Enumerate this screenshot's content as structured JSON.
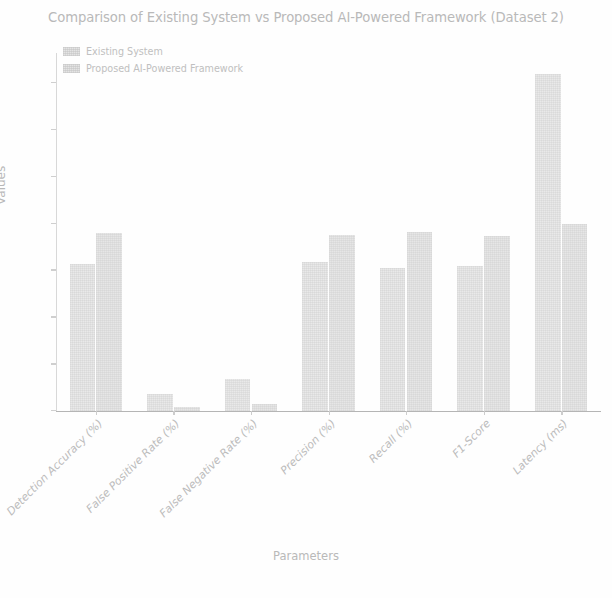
{
  "chart_data": {
    "type": "bar",
    "title": "Comparison of Existing System vs Proposed AI-Powered Framework (Dataset 2)",
    "xlabel": "Parameters",
    "ylabel": "Values",
    "categories": [
      "Detection Accuracy (%)",
      "False Positive Rate (%)",
      "False Negative Rate (%)",
      "Precision (%)",
      "Recall (%)",
      "F1-Score",
      "Latency (ms)"
    ],
    "series": [
      {
        "name": "Existing System",
        "color": "#e9e9e9",
        "values": [
          78.5,
          9.2,
          17.0,
          79.5,
          76.5,
          77.5,
          180.0
        ]
      },
      {
        "name": "Proposed AI-Powered Framework",
        "color": "#e6e6e6",
        "values": [
          95.0,
          2.0,
          4.0,
          94.0,
          95.5,
          93.5,
          100.0
        ]
      }
    ],
    "yticks": [
      0,
      25,
      50,
      75,
      100,
      125,
      150,
      175
    ],
    "ylim": [
      0,
      190
    ],
    "grid": false,
    "legend_position": "upper left",
    "xtick_rotation": -45
  },
  "legend": {
    "items": [
      {
        "label": "Existing System"
      },
      {
        "label": "Proposed AI-Powered Framework"
      }
    ]
  }
}
